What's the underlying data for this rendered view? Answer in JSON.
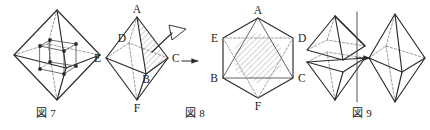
{
  "sheet": {
    "background_color": "#ffffff",
    "ink_color": "#2b2b2b",
    "hidden_line_color": "#7e7e7e",
    "width": 430,
    "height": 130
  },
  "figures": [
    {
      "id": "fig7",
      "caption": "図 7",
      "description": "regular octahedron with inscribed cube joining the eight face centres",
      "solid": "octahedron",
      "inscribed": "cube",
      "cube_vertex_count": 8
    },
    {
      "id": "fig8",
      "caption": "図 8",
      "description": "octahedron ABCDEF viewed along the direction perpendicular to face ABC, yielding a regular hexagonal outline",
      "left_solid": {
        "name": "octahedron",
        "labels": {
          "top": "A",
          "bottom": "F",
          "left": "E",
          "right": "C",
          "back": "D",
          "front": "B"
        },
        "shaded_face": "ABC",
        "view_marker": "eye-direction-arrow"
      },
      "transform_arrow": "→",
      "right_solid": {
        "name": "hexagonal projection",
        "labels": {
          "top": "A",
          "upper_left": "E",
          "upper_right": "D",
          "lower_left": "B",
          "lower_right": "C",
          "bottom": "F"
        },
        "shaded_region": "central hexagon"
      }
    },
    {
      "id": "fig9",
      "caption": "図 9",
      "description": "two square pyramids separated along a vertical axis recombining into one octahedron",
      "left_solid": "two square pyramids split apart",
      "axis_marker": "vertical split axis",
      "transform_arrow": "→",
      "right_solid": "reassembled octahedron"
    }
  ],
  "labels": {
    "A": "A",
    "B": "B",
    "C": "C",
    "D": "D",
    "E": "E",
    "F": "F"
  },
  "captions": {
    "fig7": "図 7",
    "fig8": "図 8",
    "fig9": "図 9"
  }
}
